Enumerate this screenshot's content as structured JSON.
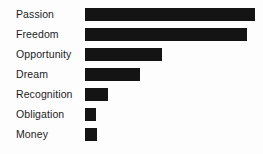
{
  "chart_data": {
    "type": "bar",
    "orientation": "horizontal",
    "title": "",
    "subtitle": "",
    "xlabel": "",
    "ylabel": "",
    "legend": [],
    "grid": false,
    "axis_visible": false,
    "tick_labels": [],
    "categories": [
      "Passion",
      "Freedom",
      "Opportunity",
      "Dream",
      "Recognition",
      "Obligation",
      "Money"
    ],
    "values": [
      170,
      162,
      77,
      55,
      23,
      11,
      12
    ],
    "value_units": "px",
    "xlim": [
      0,
      178
    ],
    "bar_color": "#141414",
    "background_color": "#fdfdfd",
    "label_color": "#1c1c1c"
  }
}
